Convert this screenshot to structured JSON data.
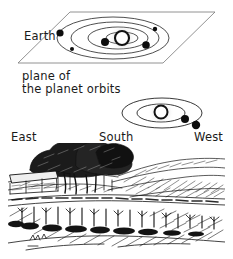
{
  "figure": {
    "title_visible": false,
    "background_color": "#ffffff",
    "ink_color": "#111111",
    "line_color": "#555555"
  },
  "labels": {
    "earth": "Earth",
    "plane_line1": "plane of",
    "plane_line2": "the planet orbits",
    "east": "East",
    "south": "South",
    "west": "West"
  },
  "top_diagram": {
    "name": "oblique-view-of-planet-orbit-plane",
    "plane_outline": "parallelogram",
    "plane_corners": [
      [
        18,
        63
      ],
      [
        70,
        12
      ],
      [
        215,
        12
      ],
      [
        163,
        63
      ]
    ],
    "sun": {
      "cx": 122,
      "cy": 38,
      "r": 7,
      "style": "open-circle"
    },
    "orbits": [
      {
        "cx": 122,
        "cy": 38,
        "rx": 16,
        "ry": 6
      },
      {
        "cx": 118,
        "cy": 38,
        "rx": 30,
        "ry": 11
      },
      {
        "cx": 115,
        "cy": 38,
        "rx": 44,
        "ry": 16
      },
      {
        "cx": 113,
        "cy": 38,
        "rx": 56,
        "ry": 21
      }
    ],
    "planets": [
      {
        "label": "Earth",
        "cx": 60,
        "cy": 33,
        "r": 3.6
      },
      {
        "label": "",
        "cx": 72,
        "cy": 49,
        "r": 2.0
      },
      {
        "label": "",
        "cx": 105,
        "cy": 42,
        "r": 4.0
      },
      {
        "label": "",
        "cx": 146,
        "cy": 45,
        "r": 3.8
      },
      {
        "label": "",
        "cx": 155,
        "cy": 29,
        "r": 2.2
      }
    ]
  },
  "bottom_diagram": {
    "name": "edge-on-view-of-planet-orbits",
    "sun": {
      "cx": 161,
      "cy": 112,
      "r": 6.5,
      "style": "open-circle"
    },
    "orbits": [
      {
        "cx": 161,
        "cy": 113,
        "rx": 24,
        "ry": 9
      },
      {
        "cx": 162,
        "cy": 113,
        "rx": 40,
        "ry": 15
      }
    ],
    "planets": [
      {
        "label": "",
        "cx": 185,
        "cy": 119,
        "r": 4.0
      },
      {
        "label": "",
        "cx": 196,
        "cy": 125,
        "r": 4.2
      }
    ]
  },
  "landscape_sketch": {
    "name": "pen-and-ink-landscape-horizon-sketch",
    "description_visible": false,
    "elements": [
      "tree-cluster",
      "barn-building",
      "rolling-hills",
      "vineyard-field",
      "horizon-line"
    ],
    "bounds": [
      8,
      143,
      225,
      252
    ]
  }
}
